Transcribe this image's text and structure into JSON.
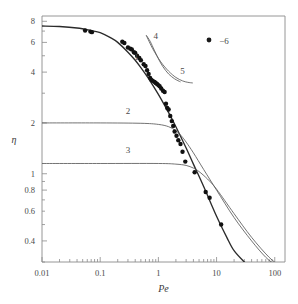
{
  "chart_data": {
    "type": "line",
    "title": "",
    "xlabel": "Pe",
    "ylabel": "η",
    "xscale": "log",
    "yscale": "log",
    "xlim": [
      0.01,
      150
    ],
    "ylim": [
      0.3,
      8.6
    ],
    "xticks": [
      0.01,
      0.1,
      1,
      10,
      100
    ],
    "xticklabels": [
      "0.01",
      "0.1",
      "1",
      "10",
      "100"
    ],
    "yticks": [
      0.4,
      0.6,
      0.8,
      1,
      2,
      4,
      6,
      8
    ],
    "yticklabels": [
      "0.4",
      "0.6",
      "0.8",
      "1",
      "2",
      "4",
      "6",
      "8"
    ],
    "grid": false,
    "legend": [
      {
        "marker": "filled-circle",
        "label": "−6",
        "color": "#1a1a1a"
      }
    ],
    "annotations": [
      {
        "text": "1",
        "x": 0.42,
        "y": 4.7
      },
      {
        "text": "2",
        "x": 0.3,
        "y": 2.25
      },
      {
        "text": "3",
        "x": 0.3,
        "y": 1.32
      },
      {
        "text": "4",
        "x": 0.9,
        "y": 6.3
      },
      {
        "text": "5",
        "x": 2.6,
        "y": 3.9
      }
    ],
    "series": [
      {
        "name": "1",
        "comment": "master experimental fit curve",
        "x": [
          0.01,
          0.02,
          0.04,
          0.07,
          0.1,
          0.15,
          0.2,
          0.3,
          0.4,
          0.5,
          0.7,
          1.0,
          1.5,
          2.0,
          3.0,
          4.0,
          6.0,
          10.0,
          15.0,
          20.0,
          30.0,
          40.0
        ],
        "values": [
          7.5,
          7.45,
          7.3,
          7.05,
          6.85,
          6.4,
          6.0,
          5.25,
          4.7,
          4.25,
          3.6,
          2.95,
          2.3,
          1.9,
          1.42,
          1.14,
          0.84,
          0.56,
          0.42,
          0.35,
          0.3,
          0.275
        ]
      },
      {
        "name": "2",
        "comment": "plateau at eta = 2, drops after Pe ~ 2",
        "x": [
          0.01,
          0.1,
          0.5,
          1.0,
          1.5,
          2.0,
          2.5,
          3.0,
          4.0,
          6.0,
          10.0,
          20.0,
          40.0,
          70.0,
          100.0
        ],
        "values": [
          2.0,
          2.0,
          1.99,
          1.96,
          1.9,
          1.8,
          1.67,
          1.54,
          1.33,
          1.06,
          0.8,
          0.55,
          0.4,
          0.32,
          0.29
        ]
      },
      {
        "name": "3",
        "comment": "plateau at eta ~ 1.15, drops after Pe ~ 3",
        "x": [
          0.01,
          0.1,
          1.0,
          2.0,
          3.0,
          4.0,
          5.0,
          7.0,
          10.0,
          20.0,
          40.0,
          80.0,
          130.0
        ],
        "values": [
          1.15,
          1.15,
          1.15,
          1.14,
          1.12,
          1.08,
          1.03,
          0.93,
          0.81,
          0.58,
          0.42,
          0.32,
          0.28
        ]
      },
      {
        "name": "4",
        "comment": "short steep branch from upper area",
        "x": [
          0.62,
          0.72,
          0.85,
          1.0,
          1.2,
          1.5,
          1.9,
          2.4
        ],
        "values": [
          6.6,
          6.1,
          5.4,
          4.8,
          4.3,
          3.9,
          3.65,
          3.5
        ]
      },
      {
        "name": "5",
        "comment": "continuation / flattening branch",
        "x": [
          0.62,
          0.8,
          1.1,
          1.5,
          2.0,
          2.6,
          3.2,
          3.9
        ],
        "values": [
          6.6,
          5.5,
          4.6,
          4.05,
          3.72,
          3.55,
          3.48,
          3.45
        ]
      }
    ],
    "scatter": {
      "name": "−6",
      "marker": "filled-circle",
      "color": "#111111",
      "x": [
        0.055,
        0.068,
        0.072,
        0.24,
        0.26,
        0.3,
        0.33,
        0.35,
        0.38,
        0.4,
        0.43,
        0.47,
        0.5,
        0.56,
        0.6,
        0.64,
        0.68,
        0.72,
        0.76,
        0.8,
        0.86,
        0.9,
        0.95,
        1.0,
        1.05,
        1.12,
        1.2,
        1.28,
        1.35,
        1.42,
        1.5,
        1.6,
        1.7,
        1.8,
        1.9,
        2.05,
        2.2,
        2.4,
        2.6,
        2.9,
        4.2,
        6.5,
        7.6,
        12.0
      ],
      "values": [
        7.05,
        6.95,
        6.9,
        6.05,
        5.95,
        5.6,
        5.5,
        5.45,
        5.25,
        5.2,
        5.0,
        4.85,
        4.7,
        4.45,
        4.35,
        4.1,
        3.9,
        3.7,
        3.6,
        3.55,
        3.5,
        3.45,
        3.4,
        3.35,
        3.3,
        3.2,
        3.1,
        3.05,
        2.6,
        2.45,
        2.4,
        2.2,
        2.05,
        1.92,
        1.78,
        1.68,
        1.58,
        1.5,
        1.35,
        1.18,
        1.02,
        0.78,
        0.72,
        0.5
      ]
    }
  },
  "style": {
    "axis_color": "#8a8a8a",
    "curve_color": "#5a5a5a",
    "master_color": "#2b2b2b",
    "point_color": "#111111",
    "text_color": "#4a4a4a"
  }
}
